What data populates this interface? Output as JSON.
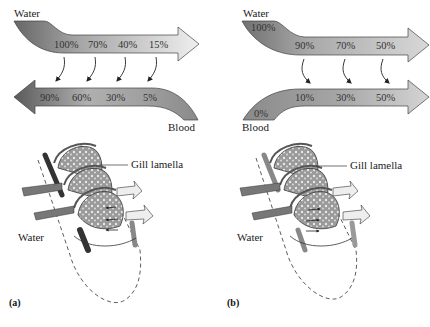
{
  "figure": {
    "panel_a": {
      "label": "(a)",
      "title": "Countercurrent exchange",
      "water_label": "Water",
      "blood_label": "Blood",
      "water_values": [
        "100%",
        "70%",
        "40%",
        "15%"
      ],
      "blood_values": [
        "90%",
        "60%",
        "30%",
        "5%"
      ],
      "gill_label": "Gill lamella",
      "gill_water_label": "Water"
    },
    "panel_b": {
      "label": "(b)",
      "title": "Concurrent exchange",
      "water_label": "Water",
      "blood_label": "Blood",
      "water_start": "100%",
      "water_values": [
        "90%",
        "70%",
        "50%"
      ],
      "blood_start": "0%",
      "blood_values": [
        "10%",
        "30%",
        "50%"
      ],
      "gill_label": "Gill lamella",
      "gill_water_label": "Water"
    },
    "colors": {
      "arrow_dark": "#6f6f6f",
      "arrow_mid": "#a9a9a9",
      "arrow_light": "#e4e4e4",
      "outline": "#3a3a3a"
    }
  }
}
